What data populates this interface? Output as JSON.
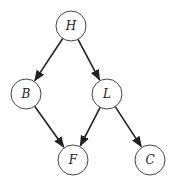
{
  "diagram": {
    "type": "directed-graph",
    "colors": {
      "node_stroke": "#444444",
      "edge": "#222222",
      "background": "#ffffff"
    },
    "nodes": [
      {
        "id": "H",
        "label": "H",
        "x": 71,
        "y": 26
      },
      {
        "id": "B",
        "label": "B",
        "x": 26,
        "y": 94
      },
      {
        "id": "L",
        "label": "L",
        "x": 107,
        "y": 94
      },
      {
        "id": "F",
        "label": "F",
        "x": 73,
        "y": 160
      },
      {
        "id": "C",
        "label": "C",
        "x": 150,
        "y": 160
      }
    ],
    "edges": [
      {
        "from": "H",
        "to": "B"
      },
      {
        "from": "H",
        "to": "L"
      },
      {
        "from": "B",
        "to": "F"
      },
      {
        "from": "L",
        "to": "F"
      },
      {
        "from": "L",
        "to": "C"
      }
    ]
  }
}
